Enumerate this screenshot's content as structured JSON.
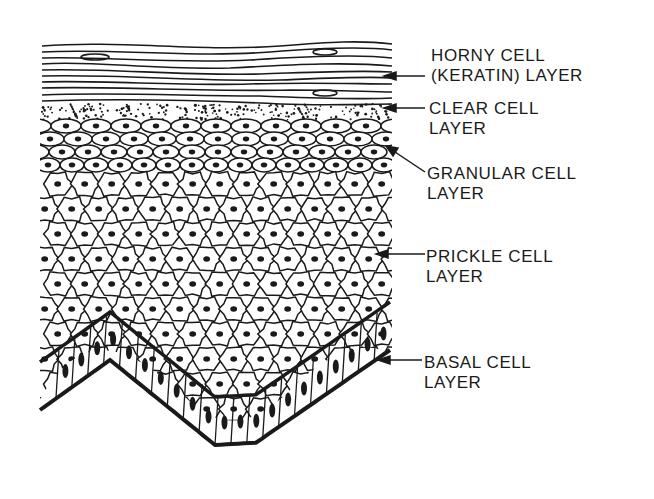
{
  "figure": {
    "colors": {
      "ink": "#1a1a1a",
      "background": "#ffffff"
    }
  },
  "labels": [
    {
      "id": "horny",
      "line1": "HORNY CELL",
      "line2": "(KERATIN) LAYER"
    },
    {
      "id": "clear",
      "line1": "CLEAR CELL",
      "line2": "LAYER"
    },
    {
      "id": "granular",
      "line1": "GRANULAR CELL",
      "line2": "LAYER"
    },
    {
      "id": "prickle",
      "line1": "PRICKLE CELL",
      "line2": "LAYER"
    },
    {
      "id": "basal",
      "line1": "BASAL CELL",
      "line2": "LAYER"
    }
  ]
}
